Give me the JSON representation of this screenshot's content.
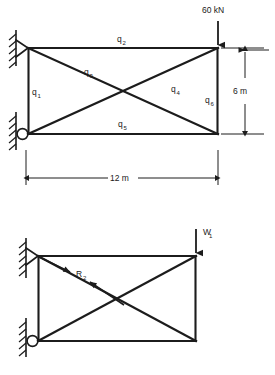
{
  "figure": {
    "stroke_color": "#1c1c1c",
    "background": "#ffffff"
  },
  "upper_diagram": {
    "name": "truss-with-member-forces",
    "load": {
      "label": "60 kN",
      "direction": "down",
      "applied_at": "top-right-node"
    },
    "members": [
      {
        "id": "q1",
        "label": "q",
        "sub": "1",
        "position": "left-vertical-chord"
      },
      {
        "id": "q2",
        "label": "q",
        "sub": "2",
        "position": "top-chord"
      },
      {
        "id": "q3",
        "label": "q",
        "sub": "3",
        "position": "diagonal-top-left-to-bottom-right"
      },
      {
        "id": "q4",
        "label": "q",
        "sub": "4",
        "position": "diagonal-bottom-left-to-top-right"
      },
      {
        "id": "q5",
        "label": "q",
        "sub": "5",
        "position": "bottom-chord"
      },
      {
        "id": "q6",
        "label": "q",
        "sub": "6",
        "position": "right-vertical-chord"
      }
    ],
    "dimensions": [
      {
        "id": "height",
        "label": "6 m",
        "orientation": "vertical",
        "side": "right"
      },
      {
        "id": "span",
        "label": "12 m",
        "orientation": "horizontal",
        "side": "bottom"
      }
    ],
    "supports": [
      {
        "id": "top-left",
        "type": "pin",
        "wall": "hatched-vertical"
      },
      {
        "id": "bottom-left",
        "type": "roller",
        "wall": "hatched-vertical"
      }
    ]
  },
  "lower_diagram": {
    "name": "truss-with-reaction",
    "load": {
      "label": "W",
      "sub": "1",
      "direction": "down",
      "applied_at": "top-right-node"
    },
    "reaction": {
      "label": "R",
      "sub": "2",
      "arrows": 2,
      "description": "double-headed reaction along diagonal"
    },
    "supports": [
      {
        "id": "top-left",
        "type": "pin",
        "wall": "hatched-vertical"
      },
      {
        "id": "bottom-left",
        "type": "roller",
        "wall": "hatched-vertical"
      }
    ]
  }
}
